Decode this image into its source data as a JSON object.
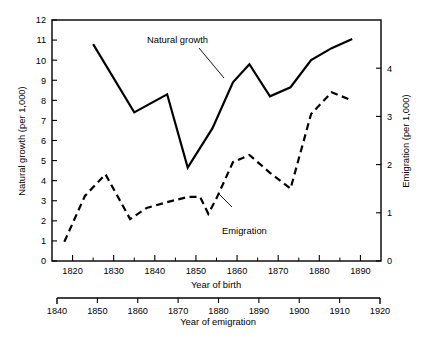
{
  "chart_data": {
    "type": "line",
    "title": "",
    "subtitle": "",
    "grid": false,
    "legend_position": "inline-annotations",
    "xlabel": "Year of birth",
    "xlabel_secondary": "Year of emigration",
    "ylabel": "Natural growth (per 1,000)",
    "ylabel_secondary": "Emigration (per 1,000)",
    "xlim": [
      1815,
      1895
    ],
    "ylim": [
      0,
      12
    ],
    "ylim_secondary": [
      0,
      5
    ],
    "xlim_secondary": [
      1840,
      1920
    ],
    "xticks": [
      1820,
      1830,
      1840,
      1850,
      1860,
      1870,
      1880,
      1890
    ],
    "xtick_labels": [
      "1820",
      "1830",
      "1840",
      "1850",
      "1860",
      "1870",
      "1880",
      "1890"
    ],
    "xticks_minor": [
      1815,
      1825,
      1835,
      1845,
      1855,
      1865,
      1875,
      1885,
      1895
    ],
    "yticks": [
      0,
      1,
      2,
      3,
      4,
      5,
      6,
      7,
      8,
      9,
      10,
      11,
      12
    ],
    "ytick_labels": [
      "0",
      "1",
      "2",
      "3",
      "4",
      "5",
      "6",
      "7",
      "8",
      "9",
      "10",
      "11",
      "12"
    ],
    "yticks_secondary": [
      0,
      1,
      2,
      3,
      4
    ],
    "ytick_labels_secondary": [
      "0",
      "1",
      "2",
      "3",
      "4"
    ],
    "xticks_secondary": [
      1840,
      1850,
      1860,
      1870,
      1880,
      1890,
      1900,
      1910,
      1920
    ],
    "xtick_labels_secondary": [
      "1840",
      "1850",
      "1860",
      "1870",
      "1880",
      "1890",
      "1900",
      "1910",
      "1920"
    ],
    "series": [
      {
        "name": "Natural growth",
        "style": "solid",
        "axis": "left",
        "x": [
          1825,
          1835,
          1843,
          1848,
          1854,
          1859,
          1863,
          1868,
          1873,
          1878,
          1883,
          1888
        ],
        "values": [
          10.8,
          7.4,
          8.3,
          4.65,
          6.6,
          8.9,
          9.8,
          8.2,
          8.65,
          10.0,
          10.6,
          11.05
        ]
      },
      {
        "name": "Emigration",
        "style": "dashed",
        "axis": "right",
        "x": [
          1818,
          1823,
          1828,
          1834,
          1838,
          1843,
          1848,
          1851,
          1853,
          1855,
          1859,
          1863,
          1868,
          1873,
          1878,
          1883,
          1888
        ],
        "values": [
          0.4,
          1.35,
          1.8,
          0.87,
          1.1,
          1.22,
          1.33,
          1.33,
          0.98,
          1.3,
          2.05,
          2.2,
          1.83,
          1.5,
          3.05,
          3.5,
          3.33
        ]
      }
    ],
    "annotations": [
      {
        "text": "Natural growth",
        "x": 1843,
        "y": 11.2
      },
      {
        "text": "Emigration",
        "x": 1856,
        "y": 2.05
      }
    ]
  },
  "axes": {
    "left_title": "Natural growth (per 1,000)",
    "right_title": "Emigration (per 1,000)",
    "bottom_title": "Year of birth",
    "bottom_secondary_title": "Year of emigration"
  },
  "colors": {
    "line": "#000000",
    "background": "#ffffff",
    "text": "#000000"
  }
}
